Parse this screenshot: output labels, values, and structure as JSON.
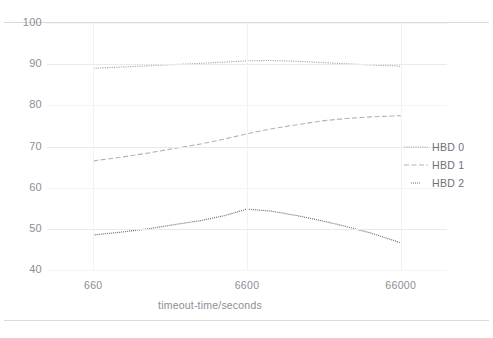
{
  "chart_data": {
    "type": "line",
    "title": "",
    "xlabel": "timeout-time/seconds",
    "ylabel": "",
    "x_scale": "log",
    "x_ticks": [
      660,
      6600,
      66000
    ],
    "x_tick_labels": [
      "660",
      "6600",
      "66000"
    ],
    "xlim": [
      330,
      132000
    ],
    "y_ticks": [
      40,
      50,
      60,
      70,
      80,
      90,
      100
    ],
    "y_tick_labels": [
      "40",
      "50",
      "60",
      "70",
      "80",
      "90",
      "100"
    ],
    "ylim": [
      40,
      100
    ],
    "grid": true,
    "legend_position": "right",
    "series": [
      {
        "name": "HBD 0",
        "style": "dotted-dense",
        "color": "#a8a8b4",
        "x": [
          660,
          1000,
          1500,
          2200,
          3300,
          4700,
          6600,
          9500,
          14000,
          20000,
          29000,
          42000,
          58000,
          66000
        ],
        "values": [
          89.0,
          89.3,
          89.6,
          89.9,
          90.2,
          90.5,
          90.8,
          90.9,
          90.7,
          90.4,
          90.1,
          89.8,
          89.6,
          89.5
        ]
      },
      {
        "name": "HBD 1",
        "style": "dashed",
        "color": "#b2b2bd",
        "x": [
          660,
          1000,
          1500,
          2200,
          3300,
          4700,
          6600,
          9500,
          14000,
          20000,
          29000,
          42000,
          58000,
          66000
        ],
        "values": [
          66.5,
          67.4,
          68.4,
          69.5,
          70.6,
          71.8,
          73.1,
          74.3,
          75.3,
          76.2,
          76.8,
          77.2,
          77.4,
          77.5
        ]
      },
      {
        "name": "HBD 2",
        "style": "dotted-sparse",
        "color": "#6d6d78",
        "x": [
          660,
          1000,
          1500,
          2200,
          3300,
          4700,
          6600,
          9500,
          14000,
          20000,
          29000,
          42000,
          58000,
          66000
        ],
        "values": [
          48.5,
          49.2,
          50.0,
          51.0,
          52.0,
          53.2,
          54.8,
          54.3,
          53.2,
          52.0,
          50.6,
          49.0,
          47.3,
          46.6
        ]
      }
    ]
  },
  "legend": {
    "items": [
      {
        "label": "HBD 0",
        "icon": "line-dotted-dense-swatch"
      },
      {
        "label": "HBD 1",
        "icon": "line-dashed-swatch"
      },
      {
        "label": "HBD 2",
        "icon": "line-dotted-sparse-swatch"
      }
    ]
  }
}
